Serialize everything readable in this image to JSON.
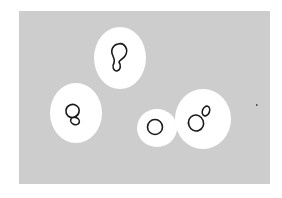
{
  "figure": {
    "background_color": "#cdcdcd",
    "capsule_color": "#ffffff",
    "cell_outline_color": "#1a1a1a",
    "cells": [
      {
        "id": "cell-top",
        "shape": "budding",
        "capsule": {
          "cx": 120,
          "cy": 58,
          "rx": 26,
          "ry": 31
        }
      },
      {
        "id": "cell-left",
        "shape": "budding",
        "capsule": {
          "cx": 76,
          "cy": 113,
          "rx": 26,
          "ry": 30
        }
      },
      {
        "id": "cell-small",
        "shape": "single",
        "capsule": {
          "cx": 157,
          "cy": 128,
          "rx": 20,
          "ry": 19
        }
      },
      {
        "id": "cell-right",
        "shape": "budding",
        "capsule": {
          "cx": 203,
          "cy": 119,
          "rx": 28,
          "ry": 30
        }
      }
    ],
    "speck": {
      "x": 256,
      "y": 105
    }
  }
}
